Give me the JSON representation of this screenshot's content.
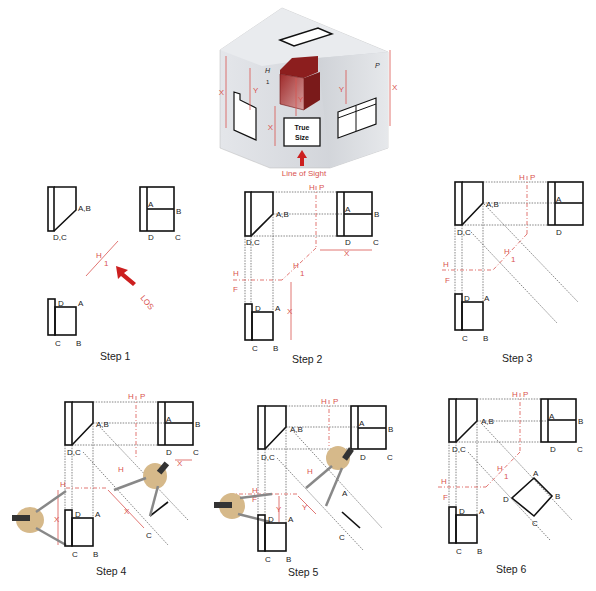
{
  "hero": {
    "true_size_line1": "True",
    "true_size_line2": "Size",
    "line_of_sight": "Line of Sight",
    "dim_x": "X",
    "dim_y": "Y",
    "fold_h": "H",
    "fold_1": "1",
    "fold_p": "P",
    "fold_f": "F"
  },
  "steps": [
    {
      "label": "Step 1"
    },
    {
      "label": "Step 2"
    },
    {
      "label": "Step 3"
    },
    {
      "label": "Step 4"
    },
    {
      "label": "Step 5"
    },
    {
      "label": "Step 6"
    }
  ],
  "labels": {
    "AB": "A,B",
    "DC": "D,C",
    "A": "A",
    "B": "B",
    "C": "C",
    "D": "D",
    "H": "H",
    "P": "P",
    "F": "F",
    "one": "1",
    "X": "X",
    "Y": "Y",
    "LOS": "LOS"
  },
  "colors": {
    "accent_red": "#d9534f",
    "arrow_red": "#cc1f1f",
    "line_black": "#111111",
    "cube_gray": "#d7dadf"
  }
}
